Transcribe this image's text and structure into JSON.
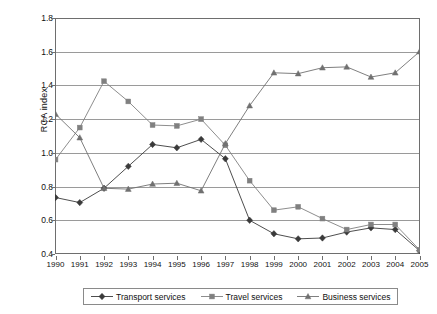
{
  "chart_data": {
    "type": "line",
    "title": "",
    "subtitle": "",
    "xlabel": "",
    "ylabel": "RCA index",
    "categories": [
      "1990",
      "1991",
      "1992",
      "1993",
      "1994",
      "1995",
      "1996",
      "1997",
      "1998",
      "1999",
      "2000",
      "2001",
      "2002",
      "2003",
      "2004",
      "2005"
    ],
    "x": [
      1990,
      1991,
      1992,
      1993,
      1994,
      1995,
      1996,
      1997,
      1998,
      1999,
      2000,
      2001,
      2002,
      2003,
      2004,
      2005
    ],
    "xlim": [
      1990,
      2005
    ],
    "ylim": [
      0.4,
      1.8
    ],
    "ytick_labels": [
      "0.4",
      "0.6",
      "0.8",
      "1.0",
      "1.2",
      "1.4",
      "1.6",
      "1.8"
    ],
    "ytick_values": [
      0.4,
      0.6,
      0.8,
      1.0,
      1.2,
      1.4,
      1.6,
      1.8
    ],
    "ytick_step": 0.2,
    "grid": "horizontal",
    "legend_position": "bottom",
    "series": [
      {
        "name": "Transport services",
        "marker": "diamond",
        "color": "#3a3a3a",
        "values": [
          0.735,
          0.705,
          0.79,
          0.92,
          1.05,
          1.03,
          1.08,
          0.965,
          0.6,
          0.52,
          0.49,
          0.495,
          0.53,
          0.555,
          0.545,
          0.42
        ]
      },
      {
        "name": "Travel services",
        "marker": "square",
        "color": "#808080",
        "values": [
          0.96,
          1.15,
          1.425,
          1.305,
          1.165,
          1.16,
          1.2,
          1.045,
          0.835,
          0.66,
          0.68,
          0.61,
          0.545,
          0.575,
          0.575,
          0.425
        ]
      },
      {
        "name": "Business services",
        "marker": "triangle",
        "color": "#707070",
        "values": [
          1.23,
          1.09,
          0.79,
          0.785,
          0.815,
          0.82,
          0.775,
          1.055,
          1.28,
          1.475,
          1.47,
          1.505,
          1.51,
          1.45,
          1.475,
          1.6
        ]
      }
    ]
  },
  "legend": {
    "items": [
      {
        "label": "Transport services",
        "marker": "diamond",
        "color": "#3a3a3a"
      },
      {
        "label": "Travel services",
        "marker": "square",
        "color": "#808080"
      },
      {
        "label": "Business services",
        "marker": "triangle",
        "color": "#707070"
      }
    ]
  },
  "axis": {
    "y_title": "RCA index"
  }
}
